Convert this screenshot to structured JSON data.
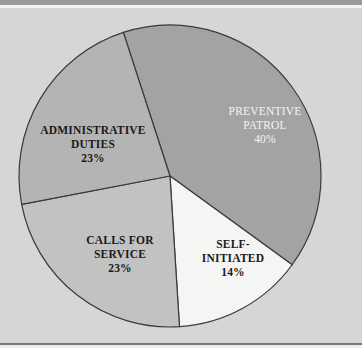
{
  "chart_data": {
    "type": "pie",
    "title": "",
    "start_angle_deg": -18,
    "direction": "clockwise",
    "slices": [
      {
        "label": "PREVENTIVE PATROL",
        "value": 40,
        "display": "40%",
        "color": "#a3a3a3",
        "text_color": "#f4f4f4"
      },
      {
        "label": "SELF-INITIATED",
        "value": 14,
        "display": "14%",
        "color": "#f5f5f3",
        "text_color": "#1a1a1a"
      },
      {
        "label": "CALLS FOR SERVICE",
        "value": 23,
        "display": "23%",
        "color": "#c2c2c2",
        "text_color": "#1a1a1a"
      },
      {
        "label": "ADMINISTRATIVE DUTIES",
        "value": 23,
        "display": "23%",
        "color": "#b4b4b4",
        "text_color": "#1a1a1a"
      }
    ],
    "legend": "none (labels inside slices)"
  },
  "labels": {
    "patrol": {
      "line1": "PREVENTIVE",
      "line2": "PATROL",
      "pct": "40%"
    },
    "self": {
      "line1": "SELF-",
      "line2": "INITIATED",
      "pct": "14%"
    },
    "calls": {
      "line1": "CALLS FOR",
      "line2": "SERVICE",
      "pct": "23%"
    },
    "admin": {
      "line1": "ADMINISTRATIVE",
      "line2": "DUTIES",
      "pct": "23%"
    }
  }
}
